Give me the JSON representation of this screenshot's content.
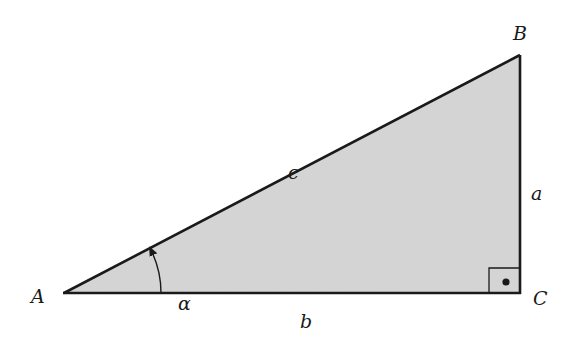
{
  "diagram": {
    "type": "right-triangle",
    "fill_color": "#d6d6d6",
    "stroke_color": "#1a1a1a",
    "vertices": {
      "A": {
        "label": "A",
        "x": 64,
        "y": 293
      },
      "B": {
        "label": "B",
        "x": 520,
        "y": 55
      },
      "C": {
        "label": "C",
        "x": 520,
        "y": 293
      }
    },
    "sides": {
      "a": {
        "label": "a",
        "between": "B-C"
      },
      "b": {
        "label": "b",
        "between": "A-C"
      },
      "c": {
        "label": "c",
        "between": "A-B"
      }
    },
    "angle": {
      "label": "α",
      "vertex": "A"
    },
    "right_angle_marker": {
      "vertex": "C",
      "dot": true
    }
  }
}
